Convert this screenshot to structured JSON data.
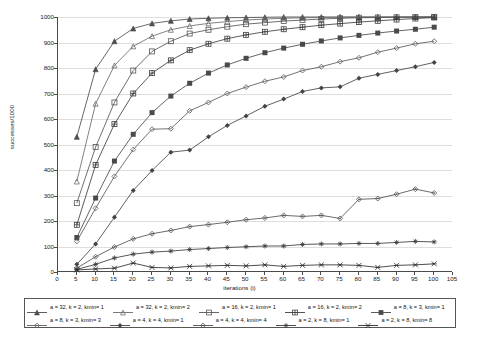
{
  "chart_data": {
    "type": "line",
    "title": "",
    "xlabel": "iterations (i)",
    "ylabel": "successes/1000",
    "xlim": [
      0,
      105
    ],
    "ylim": [
      0,
      1000
    ],
    "xticks": [
      0,
      5,
      10,
      15,
      20,
      25,
      30,
      35,
      40,
      45,
      50,
      55,
      60,
      65,
      70,
      75,
      80,
      85,
      90,
      95,
      100,
      105
    ],
    "yticks": [
      0,
      100,
      200,
      300,
      400,
      500,
      600,
      700,
      800,
      900,
      1000
    ],
    "grid": "horizontal",
    "legend_position": "bottom",
    "x": [
      5,
      10,
      15,
      20,
      25,
      30,
      35,
      40,
      45,
      50,
      55,
      60,
      65,
      70,
      75,
      80,
      85,
      90,
      95,
      100
    ],
    "series": [
      {
        "name": "a = 32, k = 2, kmin= 1",
        "marker": "triangle-filled",
        "color": "#4d4d4d",
        "values": [
          530,
          795,
          905,
          955,
          975,
          985,
          992,
          995,
          997,
          998,
          999,
          1000,
          1000,
          1000,
          1000,
          1000,
          1000,
          1000,
          1000,
          1000
        ]
      },
      {
        "name": "a = 32, k = 2, kmin= 2",
        "marker": "triangle-open",
        "color": "#6b6b6b",
        "values": [
          355,
          660,
          810,
          885,
          925,
          950,
          965,
          975,
          982,
          988,
          992,
          995,
          997,
          998,
          999,
          1000,
          1000,
          1000,
          1000,
          1000
        ]
      },
      {
        "name": "a = 16, k = 2, kmin= 1",
        "marker": "square-open",
        "color": "#555555",
        "values": [
          270,
          490,
          665,
          790,
          865,
          905,
          935,
          950,
          962,
          972,
          978,
          984,
          988,
          992,
          995,
          997,
          998,
          999,
          1000,
          1000
        ]
      },
      {
        "name": "a = 16, k = 2, kmin= 2",
        "marker": "square-crossed",
        "color": "#3f3f3f",
        "values": [
          185,
          420,
          580,
          700,
          780,
          830,
          870,
          895,
          915,
          930,
          942,
          952,
          960,
          968,
          974,
          980,
          985,
          990,
          994,
          998
        ]
      },
      {
        "name": "a = 8, k = 3, kmin= 1",
        "marker": "square-filled",
        "color": "#4a4a4a",
        "values": [
          135,
          290,
          435,
          540,
          625,
          690,
          740,
          780,
          812,
          838,
          860,
          878,
          893,
          906,
          918,
          928,
          937,
          945,
          952,
          960
        ]
      },
      {
        "name": "a = 8, k = 3, kmin= 3",
        "marker": "diamond-open",
        "color": "#5a5a5a",
        "values": [
          120,
          250,
          375,
          480,
          560,
          562,
          632,
          665,
          700,
          725,
          748,
          765,
          790,
          805,
          825,
          840,
          862,
          878,
          895,
          905
        ]
      },
      {
        "name": "a = 4, k = 4, kmin= 1",
        "marker": "diamond-filled",
        "color": "#444444",
        "values": [
          30,
          110,
          215,
          320,
          398,
          470,
          478,
          530,
          575,
          612,
          650,
          678,
          708,
          722,
          726,
          760,
          775,
          790,
          805,
          822
        ]
      },
      {
        "name": "a = 4, k = 4, kmin= 4",
        "marker": "diamond-small",
        "color": "#505050",
        "values": [
          15,
          60,
          98,
          130,
          150,
          163,
          178,
          186,
          195,
          205,
          212,
          222,
          218,
          222,
          210,
          285,
          288,
          305,
          325,
          310
        ]
      },
      {
        "name": "a = 2, k = 8, kmin= 1",
        "marker": "asterisk",
        "color": "#3a3a3a",
        "values": [
          10,
          30,
          55,
          70,
          78,
          82,
          88,
          92,
          96,
          99,
          102,
          102,
          108,
          110,
          110,
          112,
          112,
          116,
          120,
          118
        ]
      },
      {
        "name": "a = 2, k = 8, kmin= 8",
        "marker": "cross",
        "color": "#2e2e2e",
        "values": [
          8,
          12,
          15,
          35,
          18,
          16,
          22,
          24,
          26,
          24,
          28,
          22,
          26,
          28,
          28,
          26,
          18,
          26,
          28,
          32
        ]
      }
    ]
  }
}
